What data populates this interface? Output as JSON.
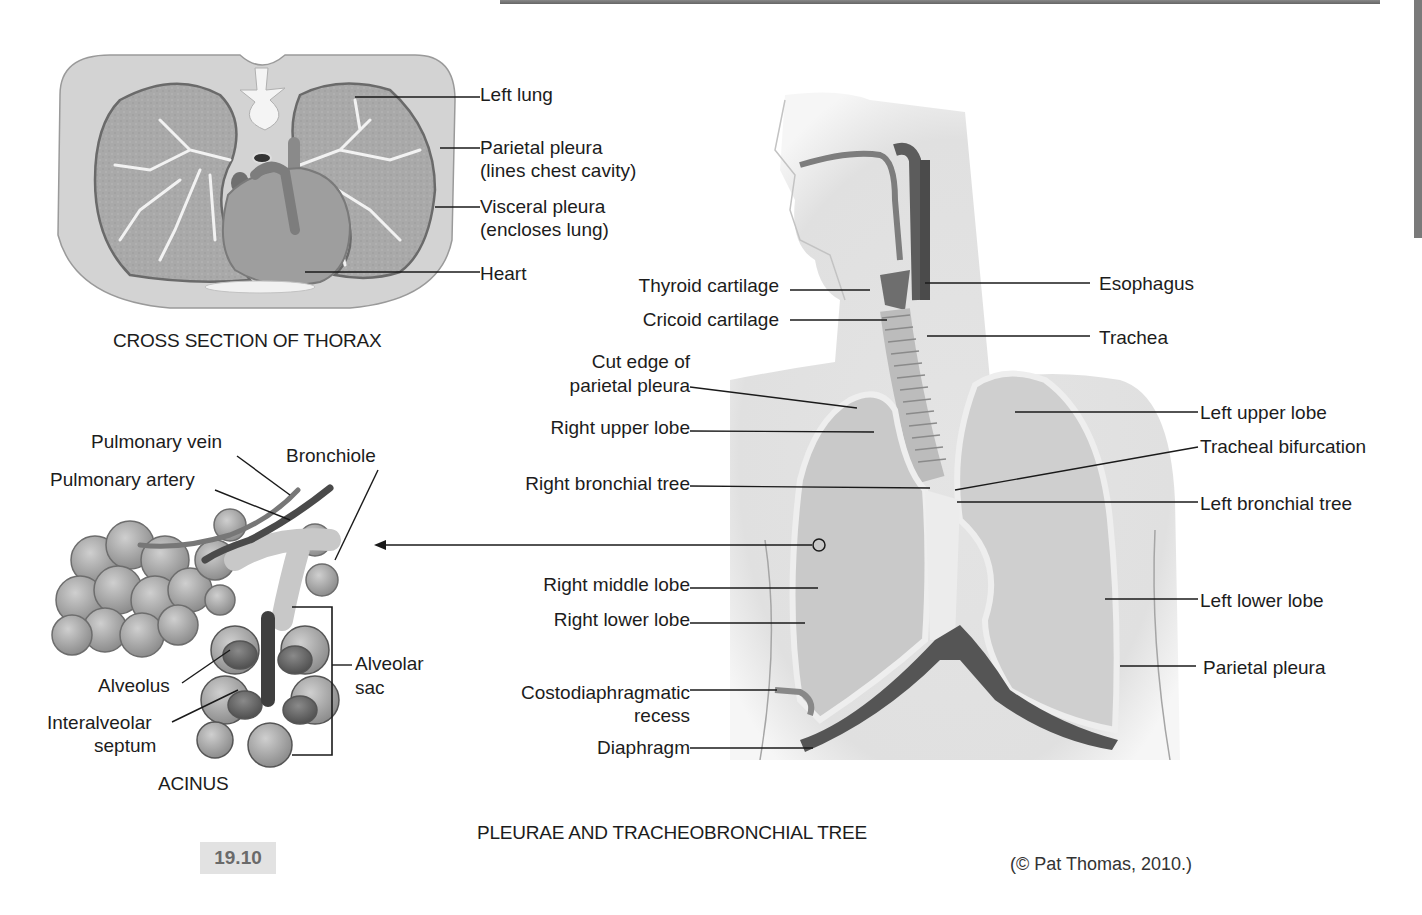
{
  "figure": {
    "number": "19.10",
    "credit": "(© Pat Thomas, 2010.)",
    "main_caption": "PLEURAE AND TRACHEOBRONCHIAL TREE"
  },
  "cross_section": {
    "caption": "CROSS SECTION OF THORAX",
    "labels": [
      {
        "text": "Left lung"
      },
      {
        "text": "Parietal pleura"
      },
      {
        "text": "(lines chest cavity)"
      },
      {
        "text": "Visceral pleura"
      },
      {
        "text": "(encloses lung)"
      },
      {
        "text": "Heart"
      }
    ]
  },
  "acinus": {
    "caption": "ACINUS",
    "labels": [
      {
        "text": "Pulmonary vein"
      },
      {
        "text": "Bronchiole"
      },
      {
        "text": "Pulmonary artery"
      },
      {
        "text": "Alveolus"
      },
      {
        "text": "Interalveolar"
      },
      {
        "text": "septum"
      },
      {
        "text": "Alveolar"
      },
      {
        "text": "sac"
      }
    ]
  },
  "tree": {
    "left_labels": [
      {
        "text": "Thyroid cartilage"
      },
      {
        "text": "Cricoid cartilage"
      },
      {
        "text": "Cut edge of"
      },
      {
        "text": "parietal pleura"
      },
      {
        "text": "Right upper lobe"
      },
      {
        "text": "Right bronchial tree"
      },
      {
        "text": "Right middle lobe"
      },
      {
        "text": "Right lower lobe"
      },
      {
        "text": "Costodiaphragmatic"
      },
      {
        "text": "recess"
      },
      {
        "text": "Diaphragm"
      }
    ],
    "right_labels": [
      {
        "text": "Esophagus"
      },
      {
        "text": "Trachea"
      },
      {
        "text": "Left upper lobe"
      },
      {
        "text": "Tracheal bifurcation"
      },
      {
        "text": "Left bronchial tree"
      },
      {
        "text": "Left lower lobe"
      },
      {
        "text": "Parietal pleura"
      }
    ]
  },
  "colors": {
    "line": "#1a1a1a",
    "tissue_light": "#d9d9d9",
    "tissue_mid": "#b5b5b5",
    "tissue_dark": "#6e6e6e",
    "badge_bg": "#e2e2e2"
  }
}
